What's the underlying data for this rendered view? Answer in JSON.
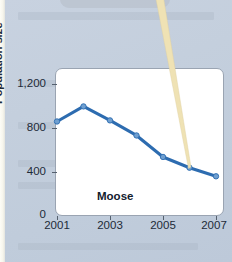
{
  "figure": {
    "background_color": "#c4cfdd",
    "plot_background": "#ffffff",
    "series_color": "#2d6cb0",
    "marker_color": "#6f9fd0",
    "pointer_color": "#efe2b4"
  },
  "axis": {
    "ylabel": "Population size",
    "y_ticks": [
      "0",
      "400",
      "800",
      "1,200"
    ],
    "x_ticks": [
      "2001",
      "2003",
      "2005",
      "2007"
    ]
  },
  "annotations": {
    "series_label": "Moose"
  },
  "chart_data": {
    "type": "line",
    "title": "",
    "xlabel": "",
    "ylabel": "Population size",
    "x": [
      2001,
      2002,
      2003,
      2004,
      2005,
      2006,
      2007
    ],
    "categories": [
      "2001",
      "2002",
      "2003",
      "2004",
      "2005",
      "2006",
      "2007"
    ],
    "series": [
      {
        "name": "Moose",
        "values": [
          870,
          1010,
          880,
          740,
          540,
          440,
          360
        ]
      }
    ],
    "values": [
      870,
      1010,
      880,
      740,
      540,
      440,
      360
    ],
    "xlim": [
      2001,
      2007
    ],
    "ylim": [
      0,
      1300
    ],
    "y_tick_values": [
      0,
      400,
      800,
      1200
    ],
    "y_tick_labels": [
      "0",
      "400",
      "800",
      "1,200"
    ],
    "x_tick_values": [
      2001,
      2003,
      2005,
      2007
    ],
    "x_tick_labels": [
      "2001",
      "2003",
      "2005",
      "2007"
    ],
    "grid": false,
    "legend": "none",
    "markers": true,
    "annotation": "Moose"
  }
}
